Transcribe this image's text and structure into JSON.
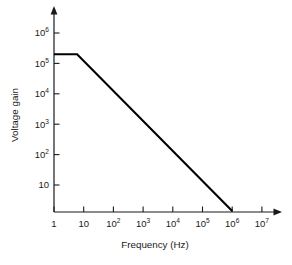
{
  "chart_data": {
    "type": "line",
    "title": "",
    "xlabel": "Frequency (Hz)",
    "ylabel": "Voltage gain",
    "xscale": "log",
    "yscale": "log",
    "grid": false,
    "legend": "none",
    "xlim": [
      1,
      10000000
    ],
    "ylim": [
      1,
      1000000
    ],
    "xticks": [
      1,
      10,
      100,
      1000,
      10000,
      100000,
      1000000,
      10000000
    ],
    "xtick_labels": [
      "1",
      "10",
      "10²",
      "10³",
      "10⁴",
      "10⁵",
      "10⁶",
      "10⁷"
    ],
    "xtick_label_parts": [
      {
        "base": "1",
        "exp": ""
      },
      {
        "base": "10",
        "exp": ""
      },
      {
        "base": "10",
        "exp": "2"
      },
      {
        "base": "10",
        "exp": "3"
      },
      {
        "base": "10",
        "exp": "4"
      },
      {
        "base": "10",
        "exp": "5"
      },
      {
        "base": "10",
        "exp": "6"
      },
      {
        "base": "10",
        "exp": "7"
      }
    ],
    "yticks": [
      10,
      100,
      1000,
      10000,
      100000,
      1000000
    ],
    "ytick_labels": [
      "10",
      "10²",
      "10³",
      "10⁴",
      "10⁵",
      "10⁶"
    ],
    "ytick_label_parts": [
      {
        "base": "10",
        "exp": ""
      },
      {
        "base": "10",
        "exp": "2"
      },
      {
        "base": "10",
        "exp": "3"
      },
      {
        "base": "10",
        "exp": "4"
      },
      {
        "base": "10",
        "exp": "5"
      },
      {
        "base": "10",
        "exp": "6"
      }
    ],
    "series": [
      {
        "name": "Open-loop voltage gain",
        "color": "#000000",
        "x": [
          1,
          6,
          1000000
        ],
        "y": [
          200000,
          200000,
          1
        ],
        "points": [
          {
            "x": 1,
            "y": 200000,
            "note": "flat region start, gain 2×10⁵"
          },
          {
            "x": 6,
            "y": 200000,
            "note": "break frequency, gain begins rolling off"
          },
          {
            "x": 1000000,
            "y": 1,
            "note": "unity-gain crossing at 10⁶ Hz"
          }
        ]
      }
    ],
    "annotations": [],
    "axis_arrows": {
      "x": true,
      "y": true
    },
    "tick_direction": "in"
  },
  "figure": {
    "background_color": "#ffffff",
    "axis_color": "#1a1a1a",
    "line_color": "#000000"
  }
}
